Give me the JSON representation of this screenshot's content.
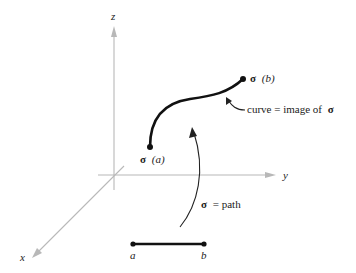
{
  "diagram": {
    "axes": {
      "x_label": "x",
      "y_label": "y",
      "z_label": "z"
    },
    "curve": {
      "start_label_sigma": "σ",
      "start_label_arg": "(a)",
      "end_label_sigma": "σ",
      "end_label_arg": "(b)",
      "annotation_prefix": "curve = image of",
      "annotation_sigma": "σ"
    },
    "path": {
      "annotation_sigma": "σ",
      "annotation_suffix": "= path"
    },
    "interval": {
      "left_label": "a",
      "right_label": "b"
    },
    "colors": {
      "axis": "#b8b8b8",
      "curve": "#111111",
      "text": "#222222"
    }
  }
}
